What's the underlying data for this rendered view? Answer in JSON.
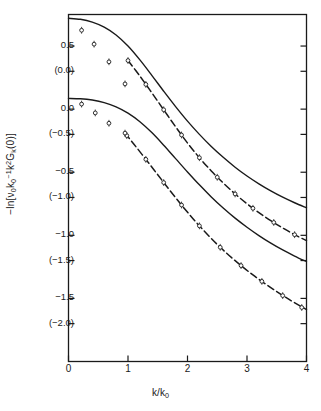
{
  "chart_data": {
    "type": "line",
    "title": "",
    "xlabel": "k/k0",
    "xlabel_parts": {
      "base": "k/k",
      "sub": "0"
    },
    "ylabel": "-ln[v0k0^-1 k^2 G_k(0)]",
    "ylabel_parts": {
      "prefix": "−ln[",
      "nu": "ν",
      "nu_sub": "0",
      "k0": "k",
      "k0_sub": "0",
      "k0_sup": "−1",
      "k2": "k",
      "k2_sup": "2",
      "G": "G",
      "G_sub": "k",
      "suffix": "(0)]"
    },
    "xlim": [
      0,
      4
    ],
    "ylim": [
      -2.0,
      0.75
    ],
    "grid": false,
    "legend": "none",
    "xticks": [
      0,
      1,
      2,
      3,
      4
    ],
    "xtick_labels": [
      "0",
      "1",
      "2",
      "3",
      "4"
    ],
    "yticks_primary": [
      0.5,
      0.0,
      -0.5,
      -1.0,
      -1.5
    ],
    "ytick_labels_primary": [
      "0.5",
      "0.0",
      "−0.5",
      "−1.0",
      "−1.5"
    ],
    "yticks_secondary": [
      0.3,
      -0.2,
      -0.7,
      -1.2,
      -1.7
    ],
    "ytick_labels_secondary": [
      "(0.0)",
      "(−0.5)",
      "(−1.0)",
      "(−1.5)",
      "(−2.0)"
    ],
    "series": [
      {
        "name": "theory-upper",
        "style": "solid",
        "markers": false,
        "points": [
          [
            0.0,
            0.72
          ],
          [
            0.2,
            0.712
          ],
          [
            0.4,
            0.69
          ],
          [
            0.6,
            0.65
          ],
          [
            0.8,
            0.588
          ],
          [
            1.0,
            0.5
          ],
          [
            1.2,
            0.39
          ],
          [
            1.4,
            0.268
          ],
          [
            1.6,
            0.142
          ],
          [
            1.8,
            0.02
          ],
          [
            2.0,
            -0.095
          ],
          [
            2.2,
            -0.2
          ],
          [
            2.4,
            -0.296
          ],
          [
            2.6,
            -0.382
          ],
          [
            2.8,
            -0.46
          ],
          [
            3.0,
            -0.53
          ],
          [
            3.2,
            -0.592
          ],
          [
            3.4,
            -0.648
          ],
          [
            3.6,
            -0.698
          ],
          [
            3.8,
            -0.742
          ],
          [
            4.0,
            -0.782
          ]
        ]
      },
      {
        "name": "data-upper",
        "style": "dashed",
        "markers": true,
        "points": [
          [
            1.0,
            0.385
          ],
          [
            1.2,
            0.262
          ],
          [
            1.4,
            0.13
          ],
          [
            1.6,
            -0.005
          ],
          [
            1.8,
            -0.14
          ],
          [
            2.0,
            -0.268
          ],
          [
            2.2,
            -0.385
          ],
          [
            2.4,
            -0.49
          ],
          [
            2.6,
            -0.585
          ],
          [
            2.8,
            -0.672
          ],
          [
            3.0,
            -0.75
          ],
          [
            3.2,
            -0.82
          ],
          [
            3.4,
            -0.884
          ],
          [
            3.6,
            -0.942
          ],
          [
            3.8,
            -0.995
          ],
          [
            4.0,
            -1.042
          ]
        ],
        "marker_points": [
          [
            1.0,
            0.385
          ],
          [
            1.3,
            0.196
          ],
          [
            1.6,
            -0.005
          ],
          [
            1.9,
            -0.205
          ],
          [
            2.2,
            -0.385
          ],
          [
            2.5,
            -0.54
          ],
          [
            2.8,
            -0.672
          ],
          [
            3.1,
            -0.786
          ],
          [
            3.45,
            -0.898
          ],
          [
            3.8,
            -0.995
          ]
        ]
      },
      {
        "name": "theory-lower",
        "style": "solid",
        "markers": false,
        "points": [
          [
            0.0,
            0.085
          ],
          [
            0.2,
            0.082
          ],
          [
            0.4,
            0.072
          ],
          [
            0.6,
            0.052
          ],
          [
            0.8,
            0.018
          ],
          [
            1.0,
            -0.032
          ],
          [
            1.2,
            -0.1
          ],
          [
            1.4,
            -0.186
          ],
          [
            1.6,
            -0.286
          ],
          [
            1.8,
            -0.392
          ],
          [
            2.0,
            -0.498
          ],
          [
            2.2,
            -0.6
          ],
          [
            2.4,
            -0.696
          ],
          [
            2.6,
            -0.784
          ],
          [
            2.8,
            -0.864
          ],
          [
            3.0,
            -0.936
          ],
          [
            3.2,
            -1.002
          ],
          [
            3.4,
            -1.062
          ],
          [
            3.6,
            -1.116
          ],
          [
            3.8,
            -1.164
          ],
          [
            4.0,
            -1.208
          ]
        ]
      },
      {
        "name": "data-lower",
        "style": "dashed",
        "markers": true,
        "points": [
          [
            0.95,
            -0.19
          ],
          [
            1.1,
            -0.278
          ],
          [
            1.3,
            -0.398
          ],
          [
            1.5,
            -0.52
          ],
          [
            1.7,
            -0.642
          ],
          [
            1.9,
            -0.76
          ],
          [
            2.1,
            -0.872
          ],
          [
            2.3,
            -0.976
          ],
          [
            2.5,
            -1.072
          ],
          [
            2.7,
            -1.16
          ],
          [
            2.9,
            -1.24
          ],
          [
            3.1,
            -1.314
          ],
          [
            3.3,
            -1.382
          ],
          [
            3.5,
            -1.446
          ],
          [
            3.7,
            -1.506
          ],
          [
            3.9,
            -1.562
          ],
          [
            4.0,
            -1.588
          ]
        ],
        "marker_points": [
          [
            0.98,
            -0.21
          ],
          [
            1.3,
            -0.398
          ],
          [
            1.6,
            -0.582
          ],
          [
            1.9,
            -0.76
          ],
          [
            2.2,
            -0.925
          ],
          [
            2.55,
            -1.095
          ],
          [
            2.9,
            -1.24
          ],
          [
            3.25,
            -1.365
          ],
          [
            3.6,
            -1.478
          ],
          [
            3.92,
            -1.572
          ]
        ]
      },
      {
        "name": "scatter-upper-lowk",
        "style": "none",
        "markers": true,
        "marker_points": [
          [
            0.22,
            0.625
          ],
          [
            0.43,
            0.515
          ],
          [
            0.68,
            0.375
          ],
          [
            0.95,
            0.2
          ]
        ]
      },
      {
        "name": "scatter-lower-lowk",
        "style": "none",
        "markers": true,
        "marker_points": [
          [
            0.22,
            0.04
          ],
          [
            0.45,
            -0.03
          ],
          [
            0.68,
            -0.112
          ],
          [
            0.95,
            -0.19
          ]
        ]
      }
    ]
  }
}
